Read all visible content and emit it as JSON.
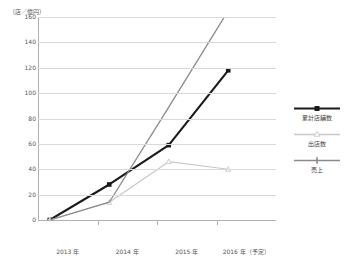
{
  "chart_data": {
    "type": "line",
    "title": "",
    "axis_unit_label": "（店／億円）",
    "categories": [
      "2013 年",
      "2014 年",
      "2015 年",
      "2016 年（予定）"
    ],
    "xlabel": "",
    "ylabel": "",
    "ylim": [
      0,
      160
    ],
    "ytick_labels": [
      "160",
      "140",
      "120",
      "100",
      "80",
      "60",
      "40",
      "20",
      "0"
    ],
    "ytick_values": [
      160,
      140,
      120,
      100,
      80,
      60,
      40,
      20,
      0
    ],
    "grid": "horizontal",
    "legend_position": "right",
    "series": [
      {
        "name": "累計店舗数",
        "values": [
          0,
          28,
          59,
          118
        ],
        "color": "#1a1a1a",
        "marker": "square",
        "width": 2.1
      },
      {
        "name": "出店数",
        "values": [
          0,
          14,
          46,
          40
        ],
        "color": "#c8c8c8",
        "marker": "triangle",
        "width": 1.2
      },
      {
        "name": "売上",
        "values": [
          0,
          14,
          89,
          165
        ],
        "color": "#8a8a8a",
        "marker": "none",
        "width": 1.3
      }
    ]
  },
  "legend": {
    "items": [
      {
        "label": "累計店舗数",
        "color": "#1a1a1a",
        "marker": "square"
      },
      {
        "label": "出店数",
        "color": "#c8c8c8",
        "marker": "triangle"
      },
      {
        "label": "売上",
        "color": "#8a8a8a",
        "marker": "bar"
      }
    ]
  }
}
